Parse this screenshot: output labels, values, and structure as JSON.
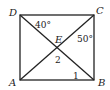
{
  "diagram": {
    "stroke_color": "#222222",
    "background": "#ffffff",
    "vertices": [
      {
        "name": "A",
        "x": 20,
        "y": 80
      },
      {
        "name": "B",
        "x": 94,
        "y": 80
      },
      {
        "name": "C",
        "x": 94,
        "y": 15
      },
      {
        "name": "D",
        "x": 20,
        "y": 15
      }
    ],
    "intersection": {
      "name": "E",
      "x": 57,
      "y": 47.5
    },
    "labels": {
      "A": "A",
      "B": "B",
      "C": "C",
      "D": "D",
      "E": "E",
      "angle_ADB": "40°",
      "angle_ACB": "50°",
      "angle_1": "1",
      "angle_2": "2"
    },
    "segments": [
      "AB",
      "BC",
      "CD",
      "DA",
      "AC",
      "BD"
    ]
  }
}
